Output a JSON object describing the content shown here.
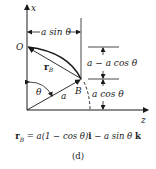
{
  "diagram": {
    "axes": {
      "vertical_label": "x",
      "horizontal_label": "z"
    },
    "points": {
      "origin_label": "O",
      "point_label": "B"
    },
    "labels": {
      "horizontal_dimension": "a sin θ",
      "upper_vertical_dimension": "a − a cos θ",
      "lower_vertical_dimension": "a cos θ",
      "position_vector": "r",
      "position_vector_sub": "B",
      "angle": "θ",
      "radius": "a"
    },
    "formula": {
      "lhs": "r",
      "lhs_sub": "B",
      "rhs_part1": " = a(1 − cos θ)",
      "unit_i": "i",
      "rhs_part2": " − a sin θ ",
      "unit_k": "k"
    },
    "caption": "(d)",
    "colors": {
      "ink": "#1a1a1a",
      "background": "#ffffff"
    }
  }
}
